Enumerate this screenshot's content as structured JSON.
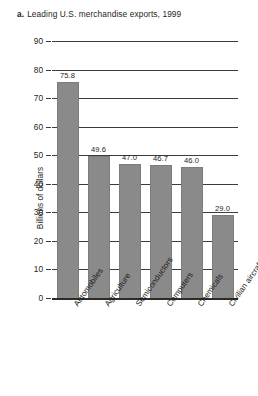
{
  "figure": {
    "marker": "a.",
    "title": "Leading U.S. merchandise exports, 1999"
  },
  "chart_data": {
    "type": "bar",
    "title": "Leading U.S. merchandise exports, 1999",
    "xlabel": "",
    "ylabel": "Billions of dollars",
    "ylim": [
      0,
      90
    ],
    "yticks": [
      0,
      10,
      20,
      30,
      40,
      50,
      60,
      70,
      80,
      90
    ],
    "ytick_labels": [
      "0",
      "10",
      "20",
      "30",
      "40",
      "50",
      "60",
      "70",
      "80",
      "90"
    ],
    "grid": true,
    "legend": "none",
    "bar_color": "#8a8a8a",
    "categories": [
      "Automobiles",
      "Agriculture",
      "Semiconductors",
      "Computers",
      "Chemicals",
      "Civilian aircraft"
    ],
    "values": [
      75.8,
      49.6,
      47.0,
      46.7,
      46.0,
      29.0
    ],
    "value_labels": [
      "75.8",
      "49.6",
      "47.0",
      "46.7",
      "46.0",
      "29.0"
    ]
  }
}
